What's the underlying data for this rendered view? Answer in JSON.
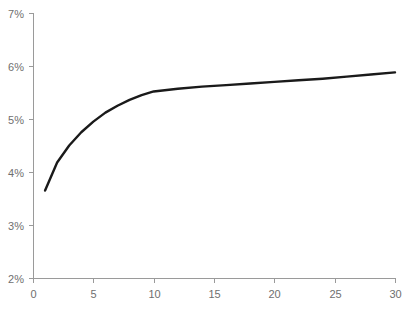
{
  "chart_data": {
    "type": "line",
    "title": "",
    "subtitle": "",
    "xlabel": "",
    "ylabel": "",
    "xlim": [
      0,
      30
    ],
    "ylim": [
      2,
      7
    ],
    "grid": false,
    "legend": false,
    "legend_position": "none",
    "y_tick_labels": [
      "2%",
      "3%",
      "4%",
      "5%",
      "6%",
      "7%"
    ],
    "y_ticks": [
      2,
      3,
      4,
      5,
      6,
      7
    ],
    "x_tick_labels": [
      "0",
      "5",
      "10",
      "15",
      "20",
      "25",
      "30"
    ],
    "x_ticks": [
      0,
      5,
      10,
      15,
      20,
      25,
      30
    ],
    "series": [
      {
        "name": "series-1",
        "color": "#1a1a1a",
        "x": [
          1,
          2,
          3,
          4,
          5,
          6,
          7,
          8,
          9,
          10,
          12,
          14,
          16,
          18,
          20,
          22,
          24,
          26,
          28,
          30
        ],
        "values": [
          3.65,
          4.18,
          4.5,
          4.75,
          4.95,
          5.12,
          5.25,
          5.36,
          5.45,
          5.52,
          5.57,
          5.61,
          5.64,
          5.67,
          5.7,
          5.73,
          5.76,
          5.8,
          5.84,
          5.88
        ]
      }
    ],
    "axis_color": "#9a9a9a",
    "label_color": "#6f6f6f",
    "background": "#ffffff"
  },
  "layout": {
    "plot_left": 33,
    "plot_right": 395,
    "plot_top": 13,
    "plot_bottom": 278
  }
}
